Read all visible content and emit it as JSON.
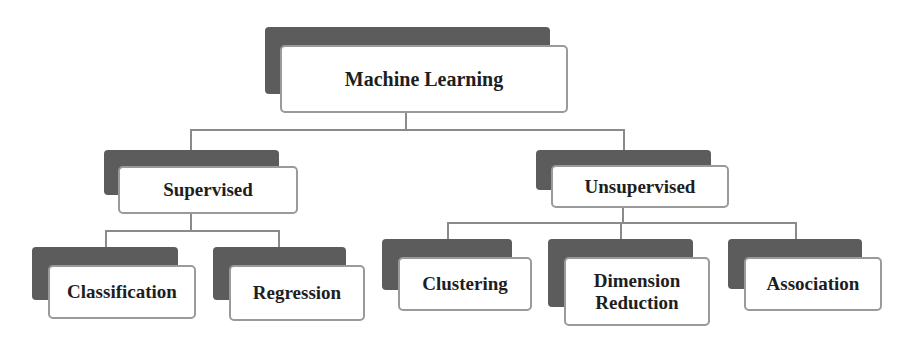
{
  "diagram": {
    "type": "hierarchy-tree",
    "root": {
      "label": "Machine Learning",
      "children": [
        {
          "label": "Supervised",
          "children": [
            {
              "label": "Classification"
            },
            {
              "label": "Regression"
            }
          ]
        },
        {
          "label": "Unsupervised",
          "children": [
            {
              "label": "Clustering"
            },
            {
              "label": "Dimension Reduction",
              "lines": [
                "Dimension",
                "Reduction"
              ]
            },
            {
              "label": "Association"
            }
          ]
        }
      ]
    }
  },
  "colors": {
    "shadow_box": "#5c5c5c",
    "card_border": "#9a9a9a",
    "connector": "#8a8a8a",
    "text": "#1e1e1e",
    "background": "#ffffff"
  }
}
